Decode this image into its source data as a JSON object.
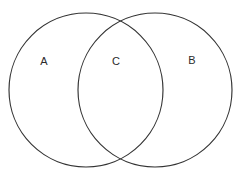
{
  "figure": {
    "background_color": "#ffffff",
    "stroke_color": "#333333",
    "label_color": "#2b2b2b",
    "stroke_width": 1.15,
    "width": 242,
    "height": 179
  },
  "sets": [
    {
      "id": "set-a",
      "label": "A",
      "name": "left-circle",
      "center_x": 86,
      "center_y": 90,
      "radius": 77
    },
    {
      "id": "set-b",
      "label": "B",
      "name": "right-circle",
      "center_x": 155,
      "center_y": 90,
      "radius": 77
    }
  ],
  "labels": [
    {
      "id": "label-a",
      "text": "A",
      "x": 44,
      "y": 62,
      "region": "left-only"
    },
    {
      "id": "label-c",
      "text": "C",
      "x": 116,
      "y": 62,
      "region": "intersection"
    },
    {
      "id": "label-b",
      "text": "B",
      "x": 192,
      "y": 61,
      "region": "right-only"
    }
  ],
  "intersections": [
    {
      "id": "intersection-top",
      "x": 120,
      "y": 15
    },
    {
      "id": "intersection-bottom",
      "x": 120,
      "y": 164
    }
  ]
}
